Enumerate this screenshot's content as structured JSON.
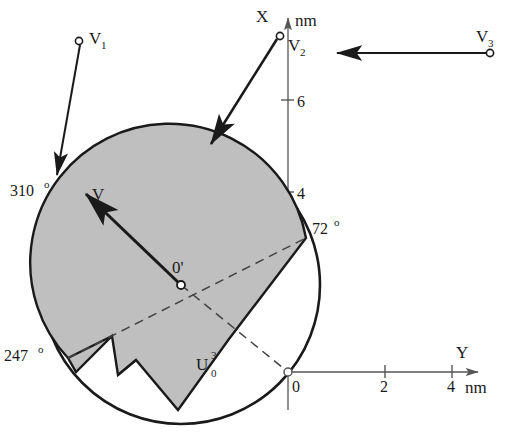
{
  "figure": {
    "axes": {
      "x_axis": {
        "label": "X",
        "unit": "nm",
        "ticks": [
          "2",
          "4",
          "6"
        ],
        "tick_values": [
          2,
          4,
          6
        ]
      },
      "y_axis": {
        "label": "Y",
        "unit": "nm",
        "ticks": [
          "0",
          "2",
          "4"
        ],
        "tick_values": [
          0,
          2,
          4
        ]
      },
      "origin_label": "0"
    },
    "center_label": "0'",
    "region_label": {
      "base": "U",
      "sub": "0",
      "sup": "3"
    },
    "angles": [
      {
        "name": "angle-310",
        "text": "310",
        "degree_symbol": "o"
      },
      {
        "name": "angle-247",
        "text": "247",
        "degree_symbol": "o"
      },
      {
        "name": "angle-72",
        "text": "72",
        "degree_symbol": "o"
      }
    ],
    "vectors": [
      {
        "name": "V",
        "base": "V",
        "sub": ""
      },
      {
        "name": "V1",
        "base": "V",
        "sub": "1"
      },
      {
        "name": "V2",
        "base": "V",
        "sub": "2"
      },
      {
        "name": "V3",
        "base": "V",
        "sub": "3"
      }
    ],
    "colors": {
      "shaded_fill": "#bfbfbf",
      "outline": "#1a1a1a",
      "axis": "#555555",
      "background": "#ffffff"
    }
  }
}
